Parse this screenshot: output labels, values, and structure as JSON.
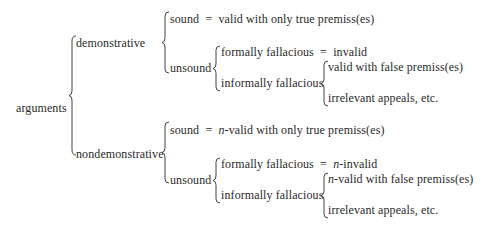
{
  "diagram": {
    "root": "arguments",
    "branches": [
      {
        "label": "demonstrative",
        "sound": {
          "label": "sound",
          "eq": "=",
          "prefix": "",
          "definition": "valid with only true premiss(es)"
        },
        "unsound": {
          "label": "unsound",
          "formal": {
            "label": "formally fallacious",
            "eq": "=",
            "prefix": "",
            "definition": "invalid"
          },
          "informal": {
            "label": "informally fallacious",
            "items": [
              {
                "prefix": "",
                "text": "valid with false premiss(es)"
              },
              {
                "prefix": "",
                "text": "irrelevant appeals, etc."
              }
            ]
          }
        }
      },
      {
        "label": "nondemonstrative",
        "sound": {
          "label": "sound",
          "eq": "=",
          "prefix": "n",
          "definition": "-valid with only true premiss(es)"
        },
        "unsound": {
          "label": "unsound",
          "formal": {
            "label": "formally fallacious",
            "eq": "=",
            "prefix": "n",
            "definition": "-invalid"
          },
          "informal": {
            "label": "informally fallacious",
            "items": [
              {
                "prefix": "n",
                "text": "-valid with false premiss(es)"
              },
              {
                "prefix": "",
                "text": "irrelevant appeals, etc."
              }
            ]
          }
        }
      }
    ]
  }
}
